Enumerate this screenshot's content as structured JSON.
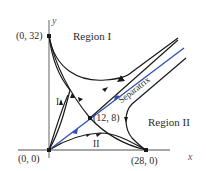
{
  "figure": {
    "axes": {
      "x_label": "x",
      "y_label": "y"
    },
    "points": {
      "top": "(0, 32)",
      "origin": "(0, 0)",
      "right": "(28, 0)",
      "saddle": "(12, 8)"
    },
    "regions": {
      "region1": "Region I",
      "region2": "Region II",
      "sub1": "I",
      "sub2": "II"
    },
    "separatrix_label": "Separatrix",
    "colors": {
      "curve": "#1a1a1a",
      "separatrix": "#2f4fb0",
      "axis": "#888888"
    }
  }
}
